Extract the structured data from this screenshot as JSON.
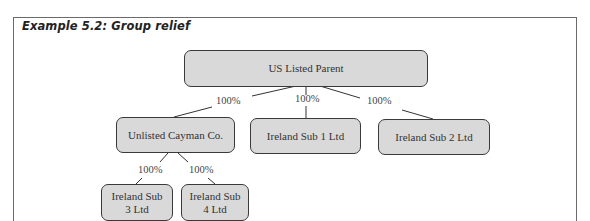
{
  "figure": {
    "title": "Example 5.2: Group relief"
  },
  "nodes": {
    "parent": "US Listed Parent",
    "cayman": "Unlisted Cayman Co.",
    "sub1": "Ireland Sub 1 Ltd",
    "sub2": "Ireland Sub 2 Ltd",
    "sub3_line1": "Ireland Sub",
    "sub3_line2": "3 Ltd",
    "sub4_line1": "Ireland Sub",
    "sub4_line2": "4 Ltd"
  },
  "edges": {
    "parent_to_cayman": "100%",
    "parent_to_sub1": "100%",
    "parent_to_sub2": "100%",
    "cayman_to_sub3": "100%",
    "cayman_to_sub4": "100%"
  },
  "colors": {
    "node_fill": "#d9d9d9",
    "node_border": "#3a3a3a",
    "frame_border": "#6a6a6a"
  }
}
